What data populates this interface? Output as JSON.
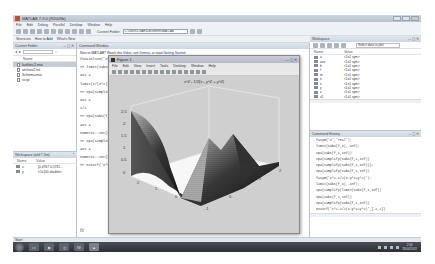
{
  "window": {
    "title": "MATLAB 7.9.0 (R2009b)",
    "menu": [
      "File",
      "Edit",
      "Debug",
      "Parallel",
      "Desktop",
      "Window",
      "Help"
    ],
    "current_folder_label": "Current Folder:",
    "current_folder_value": "C:\\Users\\CSAR\\Documents\\MATLAB",
    "shortcuts": [
      "Shortcuts",
      "How to Add",
      "What's New"
    ]
  },
  "current_folder_panel": {
    "title": "Current Folder",
    "column_header": "Name",
    "files": [
      {
        "name": "lastfunc2.mat",
        "selected": true
      },
      {
        "name": "archivo2.txt",
        "selected": false
      },
      {
        "name": "Schema.mat",
        "selected": false
      },
      {
        "name": "scrpt",
        "selected": false
      }
    ]
  },
  "workspace_small": {
    "title": "Workspace (wld:?.3m)",
    "headers": [
      "Name",
      "Value"
    ],
    "rows": [
      {
        "name": "x",
        "value": "[0.4767 0.5731..."
      },
      {
        "name": "y",
        "value": "<1x101 double>"
      }
    ]
  },
  "command_window": {
    "title": "Command Window",
    "help_text": "New to MATLAB? Watch this",
    "help_link1": "Video",
    "help_mid": ", see",
    "help_link2": "Demos",
    "help_end": ", or read",
    "help_link3": "Getting Started",
    "lines": [
      "fun=inline('x^2-1','x'); y = @(x)...",
      ">> limit(subs(f,x),...",
      "ans =",
      "limit(1/(x^2)*sin(x),inf)",
      ">> vpa(simplify(limit(f,1,inf))",
      "ans =",
      "1/2",
      ">> vpa(subs(f,1,inf))",
      "ans =",
      "numeric::int(x^2,x=0..1)",
      ">> vpa(simplify(subs(f,1,inf))",
      "ans =",
      "numeric::int(1/x^2,x=1..inf)",
      ">> ezsurf('x^2-(y-1)^2',[-2,2])"
    ],
    "prompt_symbol": "fx"
  },
  "figure": {
    "title": "Figure 1",
    "menu": [
      "File",
      "Edit",
      "View",
      "Insert",
      "Tools",
      "Desktop",
      "Window",
      "Help"
    ],
    "plot_title": "x^2 - 1/2(x - y^2 + y^2)"
  },
  "workspace_panel": {
    "title": "Workspace",
    "select_label": "Select data to plot",
    "headers": [
      "Name",
      "Value"
    ],
    "rows": [
      {
        "name": "a",
        "value": "<1x1 sym>"
      },
      {
        "name": "ans",
        "value": "<1x1 sym>"
      },
      {
        "name": "b",
        "value": "<1x1 sym>"
      },
      {
        "name": "f",
        "value": "<1x1 sym>"
      },
      {
        "name": "m",
        "value": "<1x1 sym>"
      },
      {
        "name": "n",
        "value": "<1x1 sym>"
      },
      {
        "name": "x",
        "value": "<1x1 sym>"
      },
      {
        "name": "y",
        "value": "<1x1 sym>"
      },
      {
        "name": "z",
        "value": "<1x1 sym>"
      },
      {
        "name": "z1",
        "value": "<1x1 sym>"
      }
    ]
  },
  "command_history": {
    "title": "Command History",
    "lines": [
      "f=sym('x','real');",
      "limit(subs(f,x),-inf);",
      "vpa(subs(f,1,inf))",
      "vpa(simplify(subs(f,1,inf))",
      "vpa(simplify(subs(f,1,inf)));",
      "vpa(simplify(subs(f,1,inf))",
      "f=sym('x^2-1/2(x-y^2+y^2)');",
      "limit(subs(f,x),-inf);",
      "vpa(simplify(limit(subs(f,1,inf))",
      "vpa(subs(f,1,inf))",
      "vpa(simplify(subs(f,1,inf))",
      "ezsurf('x^2-1/2(x-y^2+y^2)',[-2,2])"
    ]
  },
  "start_label": "Start",
  "taskbar": {
    "apps": [
      "explorer",
      "media",
      "chrome",
      "word",
      "matlab"
    ],
    "clock_time": "2:04",
    "clock_date": "28/04/2011"
  }
}
